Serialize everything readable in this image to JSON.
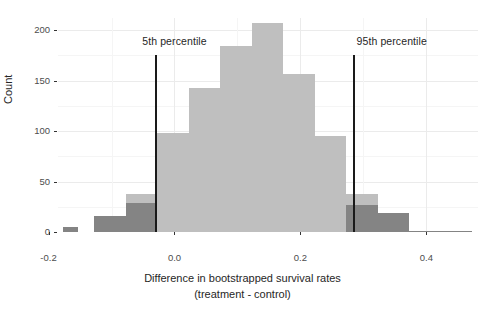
{
  "chart_data": {
    "type": "bar",
    "title": "",
    "subtitle": "",
    "xlabel": "Difference in bootstrapped survival rates",
    "xlabel_line2": "(treatment - control)",
    "ylabel": "Count",
    "xlim": [
      -0.185,
      0.482
    ],
    "ylim": [
      0,
      212
    ],
    "bin_width": 0.025,
    "grid": true,
    "legend": "none",
    "x_ticks": [
      -0.2,
      0.0,
      0.2,
      0.4
    ],
    "x_tick_labels": [
      "-0.2",
      "0.0",
      "0.2",
      "0.4"
    ],
    "x_minor_ticks": [
      -0.1,
      0.1,
      0.3
    ],
    "y_ticks": [
      0,
      50,
      100,
      150,
      200
    ],
    "y_tick_labels": [
      "0",
      "50",
      "100",
      "150",
      "200"
    ],
    "y_minor_ticks": [
      25,
      75,
      125,
      175
    ],
    "colors": {
      "inside_interval": "#bfbfbf",
      "outside_interval": "#848484",
      "reference_line": "#1a1a1a",
      "panel_background": "#ffffff",
      "major_grid": "#ebebeb",
      "minor_grid": "#f5f5f5",
      "axis_text": "#4d4d4d",
      "axis_title": "#262626"
    },
    "bins": [
      {
        "x0": -0.1775,
        "x1": -0.1525,
        "count": 5,
        "group": "outside_interval"
      },
      {
        "x0": -0.1275,
        "x1": -0.0775,
        "count": 16,
        "group": "outside_interval"
      },
      {
        "x0": -0.0775,
        "x1": -0.0275,
        "count": 29,
        "group": "outside_interval"
      },
      {
        "x0": -0.0775,
        "x1": -0.0275,
        "count": 38,
        "group": "inside_interval"
      },
      {
        "x0": -0.0275,
        "x1": 0.0225,
        "count": 98,
        "group": "inside_interval"
      },
      {
        "x0": 0.0225,
        "x1": 0.0725,
        "count": 143,
        "group": "inside_interval"
      },
      {
        "x0": 0.0725,
        "x1": 0.1225,
        "count": 184,
        "group": "inside_interval"
      },
      {
        "x0": 0.1225,
        "x1": 0.1725,
        "count": 207,
        "group": "inside_interval"
      },
      {
        "x0": 0.1725,
        "x1": 0.2225,
        "count": 157,
        "group": "inside_interval"
      },
      {
        "x0": 0.2225,
        "x1": 0.2725,
        "count": 95,
        "group": "inside_interval"
      },
      {
        "x0": 0.2725,
        "x1": 0.3225,
        "count": 38,
        "group": "inside_interval"
      },
      {
        "x0": 0.2725,
        "x1": 0.3225,
        "count": 27,
        "group": "outside_interval"
      },
      {
        "x0": 0.3225,
        "x1": 0.3725,
        "count": 19,
        "group": "outside_interval"
      },
      {
        "x0": 0.3725,
        "x1": 0.4725,
        "count": 1,
        "group": "outside_interval"
      }
    ],
    "reference_lines": [
      {
        "label": "5th percentile",
        "x": -0.029,
        "label_x": 0.0,
        "label_y": 188
      },
      {
        "label": "95th percentile",
        "x": 0.285,
        "label_x": 0.345,
        "label_y": 188
      }
    ]
  },
  "annotations": {
    "p5_label": "5th percentile",
    "p95_label": "95th percentile"
  },
  "axes": {
    "y_title": "Count",
    "x_title_line1": "Difference in bootstrapped survival rates",
    "x_title_line2": "(treatment - control)"
  }
}
